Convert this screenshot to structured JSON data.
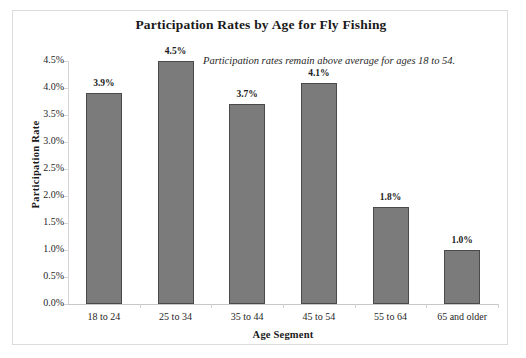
{
  "chart_data": {
    "type": "bar",
    "title": "Participation Rates by Age for Fly Fishing",
    "xlabel": "Age Segment",
    "ylabel": "Participation Rate",
    "categories": [
      "18 to 24",
      "25 to 34",
      "35 to 44",
      "45 to 54",
      "55 to 64",
      "65 and older"
    ],
    "values": [
      3.9,
      4.5,
      3.7,
      4.1,
      1.8,
      1.0
    ],
    "data_labels": [
      "3.9%",
      "4.5%",
      "3.7%",
      "4.1%",
      "1.8%",
      "1.0%"
    ],
    "ylim": [
      0.0,
      4.5
    ],
    "ytick_values": [
      0.0,
      0.5,
      1.0,
      1.5,
      2.0,
      2.5,
      3.0,
      3.5,
      4.0,
      4.5
    ],
    "ytick_labels": [
      "0.0%",
      "0.5%",
      "1.0%",
      "1.5%",
      "2.0%",
      "2.5%",
      "3.0%",
      "3.5%",
      "4.0%",
      "4.5%"
    ],
    "grid": false,
    "legend": null,
    "annotation": "Participation rates remain above average for ages 18 to 54.",
    "bar_color": "#7b7b7b",
    "bar_border_color": "#4a4a4a",
    "background_color": "#ffffff",
    "axis_color": "#d5d5d5",
    "units": "percent"
  }
}
